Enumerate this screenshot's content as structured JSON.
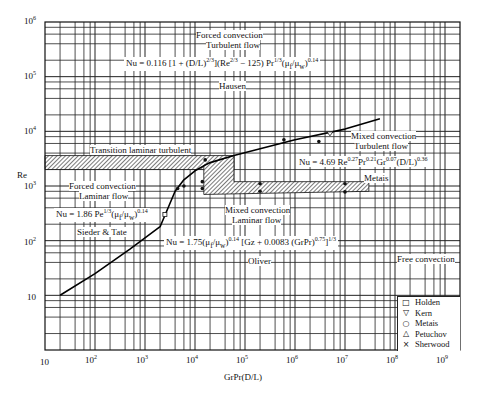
{
  "chart_data": {
    "type": "line",
    "title": "",
    "xlabel": "GrPr(D/L)",
    "ylabel": "Re",
    "xscale": "log",
    "yscale": "log",
    "xlim": [
      10,
      1000000000
    ],
    "ylim": [
      1,
      1000000
    ],
    "grid": true,
    "x_ticks": [
      "10",
      "10^2",
      "10^3",
      "10^4",
      "10^5",
      "10^6",
      "10^7",
      "10^8",
      "10^9"
    ],
    "y_ticks": [
      "10",
      "10^2",
      "10^3",
      "10^4",
      "10^5",
      "10^6"
    ],
    "series": [
      {
        "name": "Boundary curve (forced/free convection)",
        "x": [
          20,
          100,
          500,
          2000,
          4000,
          6000,
          10000,
          20000,
          60000,
          200000,
          1000000,
          10000000,
          50000000
        ],
        "y": [
          10,
          25,
          70,
          180,
          800,
          1300,
          1900,
          2700,
          3600,
          4800,
          7000,
          11000,
          17000
        ]
      }
    ],
    "regions": [
      {
        "name": "Transition laminar turbulent",
        "type": "hatched_band",
        "x": [
          10,
          60000
        ],
        "y": [
          2000,
          3600
        ]
      },
      {
        "name": "Mixed convection Laminar flow transition",
        "type": "hatched_band",
        "x": [
          15000,
          30000000
        ],
        "y": [
          800,
          1200
        ]
      }
    ],
    "region_labels": [
      {
        "text": "Forced convection Turbulent flow",
        "x": 100000,
        "y": 600000
      },
      {
        "text": "Transition laminar turbulent",
        "x": 3000,
        "y": 4000
      },
      {
        "text": "Forced convection Laminar flow",
        "x": 300,
        "y": 1000
      },
      {
        "text": "Mixed convection Laminar flow",
        "x": 100000,
        "y": 500
      },
      {
        "text": "Mixed convection Turbulent flow",
        "x": 10000000,
        "y": 8000
      },
      {
        "text": "Free convection",
        "x": 300000000,
        "y": 70
      }
    ],
    "annotations": [
      {
        "text": "Nu = 0.116 [1 + (D/L)^(2/3)] (Re^(2/3) − 125) Pr^(1/3) (μf/μw)^0.14",
        "author": "Hausen"
      },
      {
        "text": "Nu = 4.69 Re^0.27 Pr^0.21 Gr^0.07 (D/L)^0.36",
        "author": "Metais"
      },
      {
        "text": "Nu = 1.86 Pe^(1/3) (μf/μw)^0.14",
        "author": "Sieder & Tate"
      },
      {
        "text": "Nu = 1.75 (μf/μw)^0.14 [Gz + 0.0083 (GrPr)^0.75]^(1/3)",
        "author": "Oliver"
      }
    ],
    "legend": {
      "position": "lower right",
      "entries": [
        {
          "symbol": "square",
          "label": "Holden"
        },
        {
          "symbol": "triangle-down",
          "label": "Kern"
        },
        {
          "symbol": "circle",
          "label": "Metais"
        },
        {
          "symbol": "triangle-up",
          "label": "Petuchov"
        },
        {
          "symbol": "x",
          "label": "Sherwood"
        }
      ]
    }
  },
  "axes": {
    "xlabel": "GrPr(D/L)",
    "ylabel": "Re",
    "x_ticks": [
      {
        "base": "10",
        "exp": ""
      },
      {
        "base": "10",
        "exp": "2"
      },
      {
        "base": "10",
        "exp": "3"
      },
      {
        "base": "10",
        "exp": "4"
      },
      {
        "base": "10",
        "exp": "5"
      },
      {
        "base": "10",
        "exp": "6"
      },
      {
        "base": "10",
        "exp": "7"
      },
      {
        "base": "10",
        "exp": "8"
      },
      {
        "base": "10",
        "exp": "9"
      }
    ],
    "y_ticks": [
      {
        "base": "10",
        "exp": "6"
      },
      {
        "base": "10",
        "exp": "5"
      },
      {
        "base": "10",
        "exp": "4"
      },
      {
        "base": "10",
        "exp": "3"
      },
      {
        "base": "10",
        "exp": "2"
      },
      {
        "base": "10",
        "exp": ""
      }
    ]
  },
  "labels": {
    "forced_turb_1": "Forced convection",
    "forced_turb_2": "Turbulent flow",
    "transition": "Transition laminar turbulent",
    "forced_lam_1": "Forced convection",
    "forced_lam_2": "Laminar flow",
    "mixed_lam_1": "Mixed convection",
    "mixed_lam_2": "Laminar flow",
    "mixed_turb_1": "Mixed convection",
    "mixed_turb_2": "Turbulent flow",
    "free": "Free convection"
  },
  "equations": {
    "hausen": {
      "lead": "Nu = 0.116",
      "author": "Hausen"
    },
    "metais": {
      "lead": "Nu = 4.69 Re",
      "author": "Metais"
    },
    "sieder": {
      "lead": "Nu = 1.86 Pe",
      "author": "Sieder & Tate"
    },
    "oliver": {
      "lead": "Nu = 1.75",
      "author": "Oliver"
    }
  },
  "legend": [
    {
      "symbol": "□",
      "label": "Holden"
    },
    {
      "symbol": "▽",
      "label": "Kern"
    },
    {
      "symbol": "○",
      "label": "Metais"
    },
    {
      "symbol": "△",
      "label": "Petuchov"
    },
    {
      "symbol": "×",
      "label": "Sherwood"
    }
  ]
}
